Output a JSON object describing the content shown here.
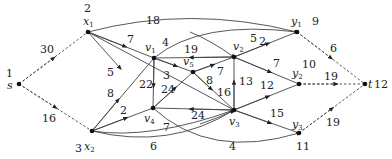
{
  "diagram": {
    "nodes": [
      {
        "id": "s",
        "num": "1",
        "label": "s",
        "sub": "",
        "x": 19,
        "y": 84,
        "num_x": 6,
        "num_y": 77,
        "lbl_x": 6,
        "lbl_y": 89
      },
      {
        "id": "x1",
        "num": "2",
        "label": "x",
        "sub": "1",
        "x": 88,
        "y": 32,
        "num_x": 84,
        "num_y": 12,
        "lbl_x": 83,
        "lbl_y": 24
      },
      {
        "id": "x2",
        "num": "3",
        "label": "x",
        "sub": "2",
        "x": 92,
        "y": 131,
        "num_x": 75,
        "num_y": 150,
        "lbl_x": 84,
        "lbl_y": 148
      },
      {
        "id": "v1",
        "num": "",
        "label": "v",
        "sub": "1",
        "x": 154,
        "y": 58,
        "num_x": 0,
        "num_y": 0,
        "lbl_x": 144,
        "lbl_y": 50
      },
      {
        "id": "v5",
        "num": "",
        "label": "v",
        "sub": "5",
        "x": 193,
        "y": 72,
        "num_x": 0,
        "num_y": 0,
        "lbl_x": 183,
        "lbl_y": 65
      },
      {
        "id": "v2",
        "num": "",
        "label": "v",
        "sub": "2",
        "x": 234,
        "y": 57,
        "num_x": 0,
        "num_y": 0,
        "lbl_x": 233,
        "lbl_y": 50
      },
      {
        "id": "v4",
        "num": "",
        "label": "v",
        "sub": "4",
        "x": 153,
        "y": 108,
        "num_x": 0,
        "num_y": 0,
        "lbl_x": 144,
        "lbl_y": 122
      },
      {
        "id": "v3",
        "num": "",
        "label": "v",
        "sub": "3",
        "x": 234,
        "y": 110,
        "num_x": 0,
        "num_y": 0,
        "lbl_x": 229,
        "lbl_y": 124
      },
      {
        "id": "y1",
        "num": "9",
        "label": "y",
        "sub": "1",
        "x": 297,
        "y": 32,
        "num_x": 312,
        "num_y": 25,
        "lbl_x": 292,
        "lbl_y": 24
      },
      {
        "id": "y2",
        "num": "10",
        "label": "y",
        "sub": "2",
        "x": 299,
        "y": 84,
        "num_x": 302,
        "num_y": 66,
        "lbl_x": 292,
        "lbl_y": 76
      },
      {
        "id": "y3",
        "num": "11",
        "label": "y",
        "sub": "3",
        "x": 299,
        "y": 133,
        "num_x": 296,
        "num_y": 148,
        "lbl_x": 292,
        "lbl_y": 128
      },
      {
        "id": "t",
        "num": "12",
        "label": "t",
        "sub": "",
        "x": 365,
        "y": 84,
        "num_x": 376,
        "num_y": 88,
        "lbl_x": 368,
        "lbl_y": 88
      }
    ],
    "edges": [
      {
        "from": "s",
        "to": "x1",
        "weight": "30",
        "style": "dashed",
        "lx": 40,
        "ly": 52
      },
      {
        "from": "s",
        "to": "x2",
        "weight": "16",
        "style": "dashed",
        "lx": 42,
        "ly": 122
      },
      {
        "from": "x1",
        "to": "y1",
        "weight": "18",
        "style": "curve-up",
        "lx": 148,
        "ly": 24
      },
      {
        "from": "x1",
        "to": "v1",
        "weight": "7",
        "style": "straight",
        "lx": 126,
        "ly": 42
      },
      {
        "from": "x1",
        "to": "v3",
        "weight": "5",
        "style": "straight",
        "lx": 106,
        "ly": 74
      },
      {
        "from": "x2",
        "to": "v1",
        "weight": "8",
        "style": "straight",
        "lx": 106,
        "ly": 96
      },
      {
        "from": "x2",
        "to": "v4",
        "weight": "2",
        "style": "straight",
        "lx": 121,
        "ly": 114
      },
      {
        "from": "x2",
        "to": "v3",
        "weight": "6",
        "style": "curve-down",
        "lx": 149,
        "ly": 148
      },
      {
        "from": "v1",
        "to": "y1",
        "weight": "4",
        "style": "curve",
        "lx": 161,
        "ly": 48
      },
      {
        "from": "v2",
        "to": "v1",
        "weight": "19",
        "style": "straight",
        "lx": 183,
        "ly": 52
      },
      {
        "from": "v1",
        "to": "v4",
        "weight": "22",
        "style": "straight",
        "lx": 140,
        "ly": 86
      },
      {
        "from": "v1",
        "to": "v5",
        "weight": "3",
        "style": "straight",
        "lx": 163,
        "ly": 79
      },
      {
        "from": "v4",
        "to": "v5",
        "weight": "24",
        "style": "straight",
        "lx": 161,
        "ly": 93
      },
      {
        "from": "v5",
        "to": "v2",
        "weight": "7",
        "style": "straight",
        "lx": 216,
        "ly": 75
      },
      {
        "from": "v5",
        "to": "v3",
        "weight": "16",
        "style": "straight",
        "lx": 218,
        "ly": 95
      },
      {
        "from": "v1",
        "to": "v2",
        "weight": "8",
        "style": "straight",
        "lx": 200,
        "ly": 84
      },
      {
        "from": "v3",
        "to": "v2",
        "weight": "13",
        "style": "straight",
        "lx": 239,
        "ly": 85
      },
      {
        "from": "v2",
        "to": "y1",
        "weight": "2",
        "style": "straight",
        "lx": 261,
        "ly": 45
      },
      {
        "from": "v2",
        "to": "y2",
        "weight": "7",
        "style": "straight",
        "lx": 272,
        "ly": 67
      },
      {
        "from": "v3",
        "to": "v4",
        "weight": "24",
        "style": "straight",
        "lx": 191,
        "ly": 119
      },
      {
        "from": "v4",
        "to": "v3",
        "weight": "7",
        "style": "curve",
        "lx": 163,
        "ly": 129
      },
      {
        "from": "v3",
        "to": "y2",
        "weight": "12",
        "style": "straight",
        "lx": 260,
        "ly": 87
      },
      {
        "from": "v3",
        "to": "y3",
        "weight": "15",
        "style": "straight",
        "lx": 270,
        "ly": 116
      },
      {
        "from": "v4",
        "to": "y3",
        "weight": "4",
        "style": "curve-down",
        "lx": 222,
        "ly": 148
      },
      {
        "from": "y1",
        "to": "t",
        "weight": "6",
        "style": "dashed",
        "lx": 330,
        "ly": 51
      },
      {
        "from": "y2",
        "to": "t",
        "weight": "19",
        "style": "dashed",
        "lx": 325,
        "ly": 80
      },
      {
        "from": "y3",
        "to": "t",
        "weight": "19",
        "style": "dashed",
        "lx": 326,
        "ly": 126
      },
      {
        "from": "y1",
        "to": "v2",
        "weight": "5",
        "style": "label-only",
        "lx": 249,
        "ly": 42
      }
    ]
  }
}
